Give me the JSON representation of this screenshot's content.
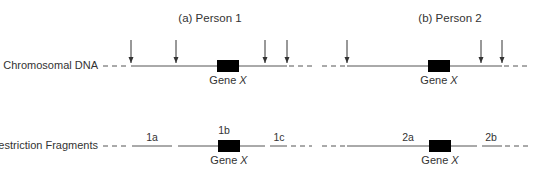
{
  "panels": [
    {
      "title": "(a) Person 1",
      "title_x": 210
    },
    {
      "title": "(b) Person 2",
      "title_x": 450
    }
  ],
  "rows": {
    "chromosomal_dna": {
      "label": "Chromosomal DNA",
      "y": 66
    },
    "restriction_fragments": {
      "label": "Restriction Fragments",
      "y": 146
    }
  },
  "gene_label": "Gene X",
  "gene_label_name": "Gene",
  "gene_label_italic": "X",
  "person1": {
    "restriction_sites_x": [
      131,
      176,
      265,
      287
    ],
    "gene_box": {
      "x1": 217,
      "x2": 239
    },
    "fragments": [
      {
        "label": "1a",
        "x1": 132,
        "x2": 172,
        "label_x": 152
      },
      {
        "label": "1b",
        "x1": 178,
        "x2": 265,
        "label_x": 228
      },
      {
        "label": "1c",
        "x1": 270,
        "x2": 287,
        "label_x": 279
      }
    ]
  },
  "person2": {
    "restriction_sites_x": [
      347,
      481,
      502
    ],
    "gene_box": {
      "x1": 428,
      "x2": 449
    },
    "fragments": [
      {
        "label": "2a",
        "x1": 347,
        "x2": 477,
        "label_x": 408
      },
      {
        "label": "2b",
        "x1": 482,
        "x2": 502,
        "label_x": 491
      }
    ]
  },
  "colors": {
    "line": "#555555",
    "gene": "#000000",
    "text": "#333333"
  }
}
